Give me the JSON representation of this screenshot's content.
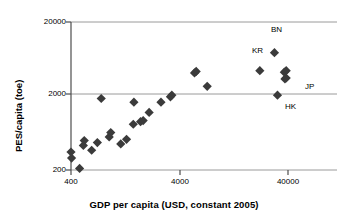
{
  "chart_data": {
    "type": "scatter",
    "title": "",
    "xlabel": "GDP per capita (USD, constant 2005)",
    "ylabel": "PES/capita (toe)",
    "xscale": "log",
    "yscale": "log",
    "xlim": [
      300,
      80000
    ],
    "ylim": [
      180,
      20000
    ],
    "xticks": [
      400,
      4000,
      40000
    ],
    "xtick_labels": [
      "400",
      "4000",
      "40000"
    ],
    "yticks": [
      200,
      2000,
      20000
    ],
    "ytick_labels": [
      "200",
      "2000",
      "20000"
    ],
    "grid": "horizontal-gridlines-at-y-ticks",
    "legend": "none",
    "marker": "filled-diamond",
    "marker_color": "#3b3b3b",
    "axis_color": "#808080",
    "points": [
      {
        "x": 400,
        "y": 350,
        "label": ""
      },
      {
        "x": 405,
        "y": 290,
        "label": ""
      },
      {
        "x": 480,
        "y": 210,
        "label": ""
      },
      {
        "x": 520,
        "y": 430,
        "label": ""
      },
      {
        "x": 530,
        "y": 500,
        "label": ""
      },
      {
        "x": 620,
        "y": 370,
        "label": ""
      },
      {
        "x": 700,
        "y": 470,
        "label": ""
      },
      {
        "x": 760,
        "y": 1850,
        "label": ""
      },
      {
        "x": 900,
        "y": 560,
        "label": ""
      },
      {
        "x": 930,
        "y": 640,
        "label": ""
      },
      {
        "x": 1150,
        "y": 450,
        "label": ""
      },
      {
        "x": 1300,
        "y": 520,
        "label": ""
      },
      {
        "x": 1500,
        "y": 830,
        "label": ""
      },
      {
        "x": 1520,
        "y": 1650,
        "label": ""
      },
      {
        "x": 1750,
        "y": 900,
        "label": ""
      },
      {
        "x": 1850,
        "y": 930,
        "label": ""
      },
      {
        "x": 2100,
        "y": 1200,
        "label": ""
      },
      {
        "x": 2700,
        "y": 1650,
        "label": ""
      },
      {
        "x": 3300,
        "y": 1950,
        "label": ""
      },
      {
        "x": 3400,
        "y": 2050,
        "label": ""
      },
      {
        "x": 5500,
        "y": 4100,
        "label": ""
      },
      {
        "x": 5700,
        "y": 4300,
        "label": ""
      },
      {
        "x": 7200,
        "y": 2700,
        "label": ""
      },
      {
        "x": 22000,
        "y": 4400,
        "label": "KR"
      },
      {
        "x": 30000,
        "y": 7700,
        "label": "BN"
      },
      {
        "x": 37000,
        "y": 4200,
        "label": ""
      },
      {
        "x": 38500,
        "y": 4400,
        "label": ""
      },
      {
        "x": 37500,
        "y": 3400,
        "label": ""
      },
      {
        "x": 38500,
        "y": 3500,
        "label": "JP"
      },
      {
        "x": 32000,
        "y": 2050,
        "label": "HK"
      }
    ],
    "annotations": [
      {
        "text": "BN",
        "near": "point-bn"
      },
      {
        "text": "KR",
        "near": "point-kr"
      },
      {
        "text": "JP",
        "near": "point-jp"
      },
      {
        "text": "HK",
        "near": "point-hk"
      }
    ]
  }
}
